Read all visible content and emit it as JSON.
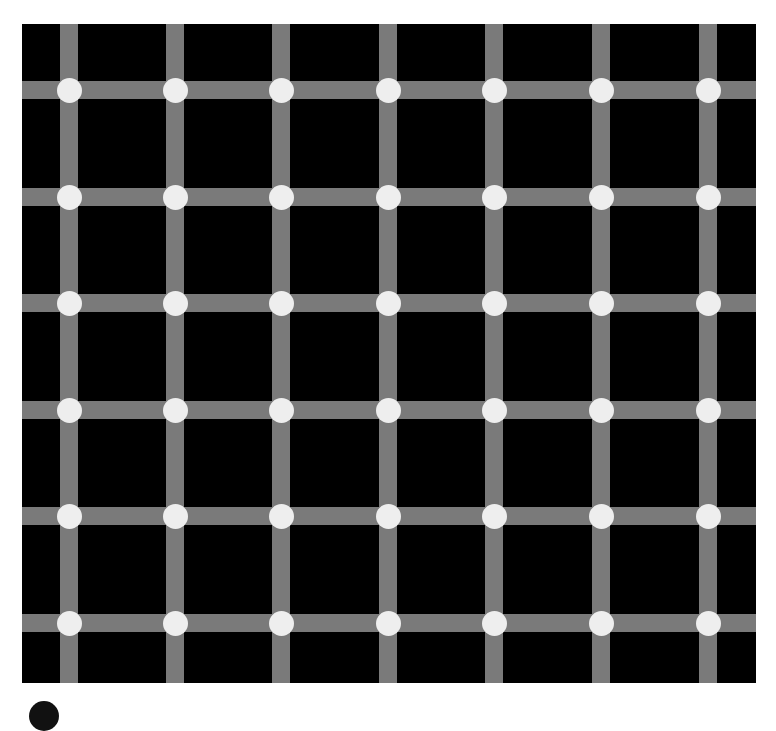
{
  "illusion": {
    "name": "Scintillating grid",
    "canvas": {
      "width": 776,
      "height": 704,
      "background": "#ffffff"
    },
    "panel": {
      "left": 22,
      "top": 24,
      "right": 756,
      "bottom": 683,
      "color": "#000000"
    },
    "grid": {
      "columns_x": [
        69,
        175,
        281,
        388,
        494,
        601,
        708
      ],
      "rows_y": [
        90,
        197,
        303,
        410,
        516,
        623
      ],
      "bar_width": 18,
      "bar_color": "#7a7a7a",
      "dot_diameter": 25,
      "dot_color": "#eeeeee"
    },
    "cropped_arc": {
      "cx": 44,
      "cy": 716,
      "diameter": 30,
      "color": "#111111"
    }
  }
}
